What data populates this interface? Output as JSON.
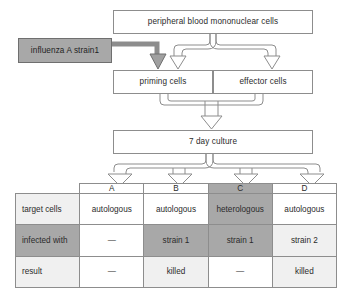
{
  "diagram": {
    "nodes": {
      "pbmc": "peripheral blood mononuclear cells",
      "influenza": "influenza A strain1",
      "priming": "priming cells",
      "effector": "effector cells",
      "culture": "7 day culture"
    },
    "colors": {
      "shaded_fill": "#a8a8a8",
      "light_fill": "#f0f0f0",
      "mid_fill": "#e3e3e3",
      "white_fill": "#ffffff",
      "line": "#8d8d8d",
      "text": "#2b2b2b"
    },
    "icons": {
      "filled_arrow": "solid-down-arrow-icon",
      "outline_arrow": "outline-down-arrow-icon"
    }
  },
  "matrix": {
    "column_headers": [
      "A",
      "B",
      "C",
      "D"
    ],
    "column_header_shading": [
      "white",
      "white",
      "dark",
      "white"
    ],
    "rows": [
      {
        "label": "target cells",
        "label_shading": "light",
        "cells": [
          "autologous",
          "autologous",
          "heterologous",
          "autologous"
        ],
        "shading": [
          "white",
          "white",
          "dark",
          "white"
        ]
      },
      {
        "label": "infected with",
        "label_shading": "dark",
        "cells": [
          "—",
          "strain 1",
          "strain 1",
          "strain 2"
        ],
        "shading": [
          "white",
          "dark",
          "dark",
          "light"
        ]
      },
      {
        "label": "result",
        "label_shading": "light",
        "cells": [
          "—",
          "killed",
          "—",
          "killed"
        ],
        "shading": [
          "white",
          "light",
          "white",
          "light"
        ]
      }
    ]
  }
}
